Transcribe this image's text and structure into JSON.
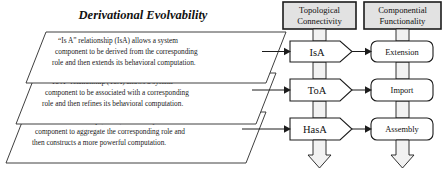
{
  "figure": {
    "title": "Derivational Evolvability",
    "background_color": "#ffffff",
    "line_color": "#1c1c1c",
    "header_fill": "#e2e2e2",
    "shape_fill": "#ffffff"
  },
  "left_panels": [
    {
      "id": "isa-panel",
      "lines": [
        "“Is A” relationship (IsA) allows a system",
        "component to be derived from the corresponding",
        "role and then extends its behavioral computation."
      ]
    },
    {
      "id": "toa-panel",
      "lines": [
        "“To A” relationship (ToA) allows a system",
        "component to be associated with a corresponding",
        "role and then refines its behavioral computation."
      ]
    },
    {
      "id": "hasa-panel",
      "lines": [
        "“Has A” relationship (HasA) allows a system",
        "component to aggregate the corresponding role and",
        "then constructs a more powerful computation."
      ]
    }
  ],
  "columns": [
    {
      "id": "topological-connectivity",
      "header_lines": [
        "Topological",
        "Connectivity"
      ],
      "nodes": [
        "IsA",
        "ToA",
        "HasA"
      ]
    },
    {
      "id": "componential-functionality",
      "header_lines": [
        "Componential",
        "Functionality"
      ],
      "nodes": [
        "Extension",
        "Import",
        "Assembly"
      ]
    }
  ],
  "arrows": {
    "panel_to_node": [
      "isa-arrow",
      "toa-arrow",
      "hasa-arrow"
    ],
    "node_to_node": [
      "isa-to-extension",
      "toa-to-import",
      "hasa-to-assembly"
    ],
    "flow_down": [
      "connectivity-flow-down",
      "functionality-flow-down"
    ]
  }
}
